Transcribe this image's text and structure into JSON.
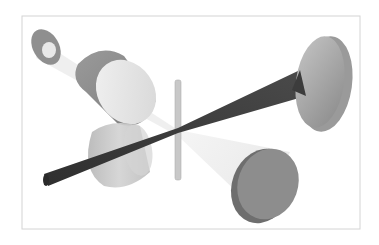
{
  "figure": {
    "frame": {
      "x": 22,
      "y": 16,
      "width": 338,
      "height": 213,
      "stroke": "#d4d4d4"
    },
    "colors": {
      "background": "#ffffff",
      "frame": "#d4d4d4",
      "disc_gray": "#8f8f8f",
      "disc_dark": "#6e6e6e",
      "light_disc": "#bdbdbd",
      "lens_translucent": "#c9c9c9",
      "beam_dark": "#3a3a3a",
      "beam_light": "#ececec",
      "slit": "#c8c8c8"
    },
    "elements": [
      {
        "id": "source-disc",
        "label": "small source disc (top-left)"
      },
      {
        "id": "large-lens",
        "label": "large cylindrical lens (upper-left)"
      },
      {
        "id": "slit",
        "label": "vertical slit / sample bar (center)"
      },
      {
        "id": "dark-beam",
        "label": "dark converging/diverging beam"
      },
      {
        "id": "small-lens",
        "label": "translucent cylinder lens (lower-left)"
      },
      {
        "id": "rod",
        "label": "dark rod entering from lower-left"
      },
      {
        "id": "right-disc",
        "label": "large disc detector (upper-right)"
      },
      {
        "id": "bottom-disc",
        "label": "disc detector (lower-right)"
      },
      {
        "id": "light-beam",
        "label": "light cone beam to lower-right"
      }
    ]
  }
}
